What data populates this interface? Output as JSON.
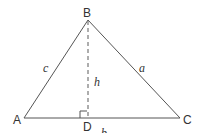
{
  "diagram": {
    "type": "triangle-with-altitude",
    "colors": {
      "stroke": "#555555",
      "text": "#333333",
      "background": "#ffffff"
    },
    "vertices": {
      "A": {
        "label": "A",
        "x": 24,
        "y": 118
      },
      "B": {
        "label": "B",
        "x": 88,
        "y": 20
      },
      "C": {
        "label": "C",
        "x": 180,
        "y": 118
      },
      "D": {
        "label": "D",
        "x": 87,
        "y": 118
      }
    },
    "sides": {
      "a": {
        "label": "a",
        "from": "B",
        "to": "C"
      },
      "b": {
        "label": "b",
        "from": "A",
        "to": "C"
      },
      "c": {
        "label": "c",
        "from": "A",
        "to": "B"
      }
    },
    "altitude": {
      "label": "h",
      "from": "B",
      "to": "D",
      "style": "dashed"
    },
    "right_angle_marker": {
      "at": "D"
    }
  }
}
